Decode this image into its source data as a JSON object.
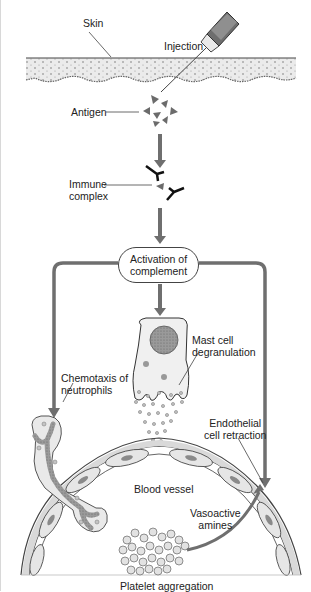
{
  "labels": {
    "skin": "Skin",
    "injection": "Injection",
    "antigen": "Antigen",
    "immune_complex_line1": "Immune",
    "immune_complex_line2": "complex",
    "activation_line1": "Activation of",
    "activation_line2": "complement",
    "mast_cell_line1": "Mast cell",
    "mast_cell_line2": "degranulation",
    "chemotaxis_line1": "Chemotaxis of",
    "chemotaxis_line2": "neutrophils",
    "endothelial_line1": "Endothelial",
    "endothelial_line2": "cell retraction",
    "blood_vessel": "Blood vessel",
    "vasoactive_line1": "Vasoactive",
    "vasoactive_line2": "amines",
    "platelet": "Platelet aggregation"
  },
  "colors": {
    "arrow": "#6f6f6f",
    "skin_fill": "#e9e9e9",
    "cell_fill": "#ececec",
    "nucleus": "#8a8a8a",
    "outline": "#3a3a3a"
  }
}
